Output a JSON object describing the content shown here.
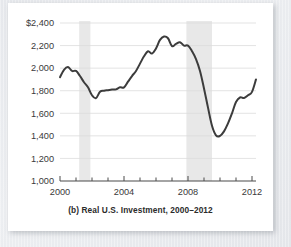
{
  "figure": {
    "caption": "(b) Real U.S. Investment, 2000–2012",
    "card_background": "#ffffff",
    "page_background": "#e9ebef"
  },
  "chart_data": {
    "type": "line",
    "title": "(b) Real U.S. Investment, 2000–2012",
    "xlabel": "",
    "ylabel": "",
    "ylim": [
      1000,
      2400
    ],
    "xlim": [
      2000,
      2012.25
    ],
    "grid": true,
    "legend_position": "none",
    "line_color": "#3c3c3c",
    "y_ticks": [
      1000,
      1200,
      1400,
      1600,
      1800,
      2000,
      2200,
      2400
    ],
    "y_tick_labels": [
      "1,000",
      "1,200",
      "1,400",
      "1,600",
      "1,800",
      "2,000",
      "2,200",
      "$2,400"
    ],
    "x_ticks": [
      2000,
      2004,
      2008,
      2012
    ],
    "x_tick_labels": [
      "2000",
      "2004",
      "2008",
      "2012"
    ],
    "x_minor_ticks": [
      2001,
      2002,
      2003,
      2005,
      2006,
      2007,
      2009,
      2010,
      2011
    ],
    "recession_bands": [
      {
        "start": 2001.2,
        "end": 2001.9,
        "color": "#e8e8e8"
      },
      {
        "start": 2007.9,
        "end": 2009.5,
        "color": "#e8e8e8"
      }
    ],
    "x": [
      2000.0,
      2000.25,
      2000.5,
      2000.75,
      2001.0,
      2001.25,
      2001.5,
      2001.75,
      2002.0,
      2002.25,
      2002.5,
      2002.75,
      2003.0,
      2003.25,
      2003.5,
      2003.75,
      2004.0,
      2004.25,
      2004.5,
      2004.75,
      2005.0,
      2005.25,
      2005.5,
      2005.75,
      2006.0,
      2006.25,
      2006.5,
      2006.75,
      2007.0,
      2007.25,
      2007.5,
      2007.75,
      2008.0,
      2008.25,
      2008.5,
      2008.75,
      2009.0,
      2009.25,
      2009.5,
      2009.75,
      2010.0,
      2010.25,
      2010.5,
      2010.75,
      2011.0,
      2011.25,
      2011.5,
      2011.75,
      2012.0,
      2012.25
    ],
    "values": [
      1920,
      1985,
      2010,
      1975,
      1975,
      1930,
      1875,
      1830,
      1760,
      1735,
      1790,
      1800,
      1805,
      1810,
      1812,
      1830,
      1830,
      1880,
      1930,
      1975,
      2040,
      2105,
      2150,
      2130,
      2175,
      2250,
      2280,
      2265,
      2195,
      2215,
      2230,
      2200,
      2200,
      2150,
      2080,
      1975,
      1820,
      1650,
      1490,
      1405,
      1400,
      1440,
      1510,
      1600,
      1700,
      1740,
      1735,
      1760,
      1790,
      1900
    ],
    "peak": {
      "year": 2006.5,
      "value": 2280
    },
    "trough": {
      "year": 2009.9,
      "value": 1400
    },
    "end_value": 1900,
    "start_value": 1920,
    "units": "billions of dollars"
  }
}
